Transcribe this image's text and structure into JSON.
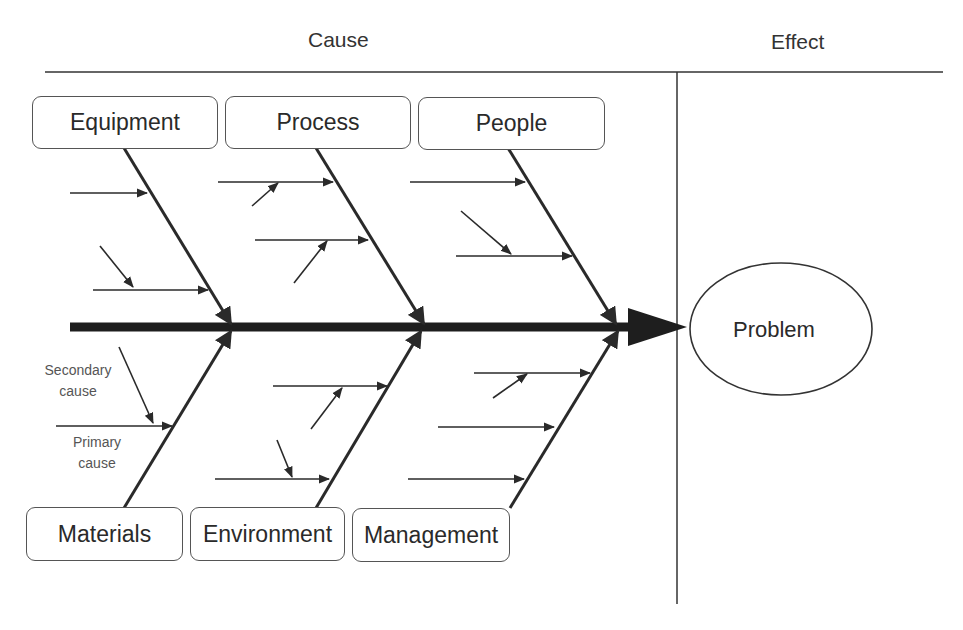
{
  "header": {
    "cause_label": "Cause",
    "effect_label": "Effect"
  },
  "diagram": {
    "type": "fishbone",
    "effect": {
      "label": "Problem"
    },
    "top_categories": [
      {
        "label": "Equipment"
      },
      {
        "label": "Process"
      },
      {
        "label": "People"
      }
    ],
    "bottom_categories": [
      {
        "label": "Materials"
      },
      {
        "label": "Environment"
      },
      {
        "label": "Management"
      }
    ],
    "legend": {
      "secondary_cause": "Secondary cause",
      "secondary_cause_line1": "Secondary",
      "secondary_cause_line2": "cause",
      "primary_cause": "Primary cause",
      "primary_cause_line1": "Primary",
      "primary_cause_line2": "cause"
    },
    "colors": {
      "line": "#2a2a2a",
      "box_border": "#555555",
      "background": "#ffffff"
    }
  }
}
